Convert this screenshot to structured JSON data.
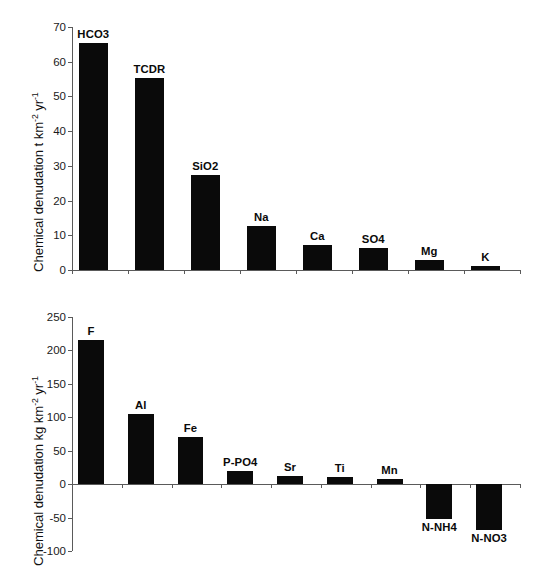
{
  "figure": {
    "background": "#ffffff",
    "bar_color": "#0a0a0a",
    "axis_color": "#5a5a5a"
  },
  "chart_data": [
    {
      "id": "top",
      "type": "bar",
      "title": "",
      "xlabel": "",
      "ylabel": "Chemical denudation t km-2 yr-1",
      "ylabel_parts": {
        "pre": "Chemical denudation t km",
        "sup1": "-2",
        "mid": " yr",
        "sup2": "-1"
      },
      "units": "t km^-2 yr^-1",
      "categories": [
        "HCO3",
        "TCDR",
        "SiO2",
        "Na",
        "Ca",
        "SO4",
        "Mg",
        "K"
      ],
      "values": [
        65.5,
        55.4,
        27.5,
        12.6,
        7.3,
        6.2,
        3.0,
        1.2
      ],
      "ylim": [
        0,
        70
      ],
      "yticks": [
        0,
        10,
        20,
        30,
        40,
        50,
        60,
        70
      ],
      "ytick_labels": [
        "0",
        "10",
        "20",
        "30",
        "40",
        "50",
        "60",
        "70"
      ],
      "grid": false,
      "legend": false
    },
    {
      "id": "bottom",
      "type": "bar",
      "title": "",
      "xlabel": "",
      "ylabel": "Chemical denudation kg km-2 yr-1",
      "ylabel_parts": {
        "pre": "Chemical denudation kg km",
        "sup1": "-2",
        "mid": " yr",
        "sup2": "-1"
      },
      "units": "kg km^-2 yr^-1",
      "categories": [
        "F",
        "Al",
        "Fe",
        "P-PO4",
        "Sr",
        "Ti",
        "Mn",
        "N-NH4",
        "N-NO3"
      ],
      "values": [
        215,
        105,
        70,
        20,
        12,
        10,
        8,
        -52,
        -68
      ],
      "ylim": [
        -100,
        250
      ],
      "yticks": [
        -100,
        -50,
        0,
        50,
        100,
        150,
        200,
        250
      ],
      "ytick_labels": [
        "-100",
        "-50",
        "0",
        "50",
        "100",
        "150",
        "200",
        "250"
      ],
      "grid": false,
      "legend": false
    }
  ]
}
